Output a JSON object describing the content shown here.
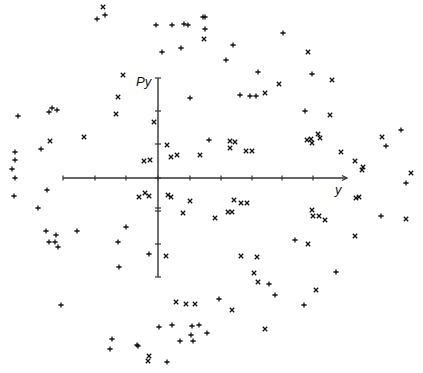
{
  "chart_data": {
    "type": "scatter",
    "title": "",
    "xlabel": "y",
    "ylabel": "Py",
    "grid": false,
    "legend": null,
    "axes": {
      "origin_px": [
        158,
        178
      ],
      "x_axis": {
        "from_px": 63,
        "to_px": 347,
        "y_px": 178,
        "ticks_px": [
          63,
          95,
          126,
          158,
          190,
          221,
          252,
          282,
          313
        ],
        "arrow": true
      },
      "y_axis": {
        "x_px": 158,
        "from_px": 78,
        "to_px": 277,
        "ticks_px": [
          78,
          111,
          144,
          178,
          208,
          211,
          244,
          277
        ],
        "arrow": true
      }
    },
    "tick_labels": [],
    "note": "Phase-space plot; points are pixel positions in a 423x373 frame. Two marker types: 'x' (cross) and '+' (plus).",
    "series": [
      {
        "name": "x-markers",
        "marker": "x",
        "points": [
          [
            103,
            7
          ],
          [
            204,
            39
          ],
          [
            123,
            75
          ],
          [
            118,
            97
          ],
          [
            116,
            114
          ],
          [
            154,
            122
          ],
          [
            50,
            141
          ],
          [
            84,
            137
          ],
          [
            167,
            145
          ],
          [
            144,
            161
          ],
          [
            150,
            160
          ],
          [
            171,
            157
          ],
          [
            177,
            155
          ],
          [
            200,
            155
          ],
          [
            308,
            52
          ],
          [
            332,
            80
          ],
          [
            279,
            84
          ],
          [
            265,
            93
          ],
          [
            330,
            115
          ],
          [
            382,
            137
          ],
          [
            230,
            148
          ],
          [
            230,
            141
          ],
          [
            235,
            142
          ],
          [
            246,
            151
          ],
          [
            252,
            151
          ],
          [
            307,
            140
          ],
          [
            311,
            139
          ],
          [
            312,
            143
          ],
          [
            318,
            134
          ],
          [
            320,
            138
          ],
          [
            341,
            152
          ],
          [
            355,
            161
          ],
          [
            363,
            167
          ],
          [
            362,
            170
          ],
          [
            411,
            173
          ],
          [
            356,
            198
          ],
          [
            359,
            197
          ],
          [
            406,
            219
          ],
          [
            234,
            200
          ],
          [
            241,
            203
          ],
          [
            247,
            203
          ],
          [
            228,
            212
          ],
          [
            232,
            212
          ],
          [
            215,
            218
          ],
          [
            312,
            210
          ],
          [
            313,
            216
          ],
          [
            319,
            216
          ],
          [
            325,
            220
          ],
          [
            308,
            244
          ],
          [
            355,
            236
          ],
          [
            241,
            256
          ],
          [
            257,
            257
          ],
          [
            254,
            273
          ],
          [
            258,
            282
          ],
          [
            232,
            310
          ],
          [
            316,
            290
          ],
          [
            265,
            329
          ],
          [
            139,
            197
          ],
          [
            145,
            193
          ],
          [
            149,
            196
          ],
          [
            168,
            195
          ],
          [
            171,
            197
          ],
          [
            190,
            201
          ],
          [
            183,
            213
          ],
          [
            166,
            256
          ],
          [
            176,
            302
          ],
          [
            186,
            304
          ],
          [
            195,
            304
          ],
          [
            149,
            356
          ],
          [
            148,
            361
          ]
        ]
      },
      {
        "name": "plus-markers",
        "marker": "+",
        "points": [
          [
            97,
            19
          ],
          [
            105,
            15
          ],
          [
            156,
            25
          ],
          [
            172,
            25
          ],
          [
            184,
            24
          ],
          [
            188,
            25
          ],
          [
            203,
            17
          ],
          [
            205,
            17
          ],
          [
            205,
            29
          ],
          [
            162,
            52
          ],
          [
            181,
            48
          ],
          [
            190,
            98
          ],
          [
            18,
            116
          ],
          [
            49,
            112
          ],
          [
            52,
            108
          ],
          [
            57,
            110
          ],
          [
            41,
            149
          ],
          [
            209,
            140
          ],
          [
            15,
            152
          ],
          [
            15,
            160
          ],
          [
            12,
            169
          ],
          [
            15,
            178
          ],
          [
            283,
            33
          ],
          [
            233,
            45
          ],
          [
            226,
            60
          ],
          [
            258,
            72
          ],
          [
            312,
            74
          ],
          [
            240,
            95
          ],
          [
            250,
            96
          ],
          [
            256,
            96
          ],
          [
            305,
            111
          ],
          [
            401,
            130
          ],
          [
            386,
            146
          ],
          [
            406,
            183
          ],
          [
            381,
            216
          ],
          [
            295,
            240
          ],
          [
            336,
            272
          ],
          [
            269,
            284
          ],
          [
            275,
            295
          ],
          [
            219,
            299
          ],
          [
            304,
            305
          ],
          [
            14,
            196
          ],
          [
            47,
            190
          ],
          [
            38,
            208
          ],
          [
            46,
            231
          ],
          [
            56,
            235
          ],
          [
            77,
            231
          ],
          [
            49,
            242
          ],
          [
            55,
            242
          ],
          [
            58,
            247
          ],
          [
            126,
            227
          ],
          [
            118,
            242
          ],
          [
            149,
            254
          ],
          [
            119,
            267
          ],
          [
            61,
            305
          ],
          [
            159,
            327
          ],
          [
            172,
            325
          ],
          [
            192,
            326
          ],
          [
            199,
            325
          ],
          [
            191,
            335
          ],
          [
            207,
            333
          ],
          [
            180,
            341
          ],
          [
            193,
            341
          ],
          [
            112,
            339
          ],
          [
            110,
            349
          ],
          [
            137,
            345
          ],
          [
            138,
            346
          ],
          [
            167,
            362
          ]
        ]
      }
    ]
  },
  "labels": {
    "x_axis": "y",
    "y_axis": "Py"
  },
  "colors": {
    "ink": "#111111",
    "axis": "#333333",
    "background": "#ffffff"
  }
}
